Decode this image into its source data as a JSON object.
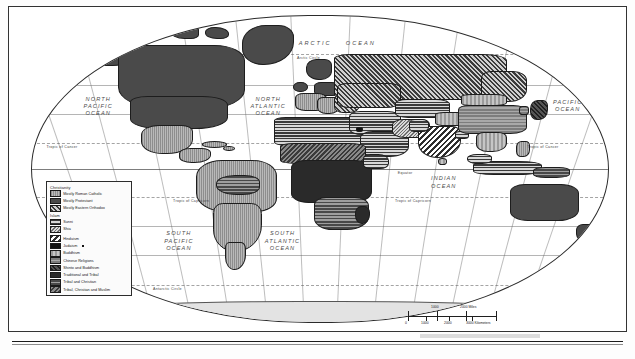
{
  "map": {
    "title_visible": false,
    "projection": "robinson-ellipse",
    "legend": {
      "groups": [
        {
          "header": "Christianity",
          "items": [
            {
              "label": "Mostly Roman Catholic",
              "pattern": "p-catholic"
            },
            {
              "label": "Mostly Protestant",
              "pattern": "p-protestant"
            },
            {
              "label": "Mostly Eastern Orthodox",
              "pattern": "p-orthodox"
            }
          ]
        },
        {
          "header": "Islam",
          "items": [
            {
              "label": "Sunni",
              "pattern": "p-sunni"
            },
            {
              "label": "Shia",
              "pattern": "p-shia"
            }
          ]
        },
        {
          "header": "",
          "items": [
            {
              "label": "Hinduism",
              "pattern": "p-hindu"
            },
            {
              "label": "Judaism",
              "pattern": "p-judaism",
              "dot": true
            },
            {
              "label": "Buddhism",
              "pattern": "p-buddhism"
            },
            {
              "label": "Chinese Religions",
              "pattern": "p-chinese"
            },
            {
              "label": "Shinto and Buddhism",
              "pattern": "p-shinto"
            },
            {
              "label": "Traditional and Tribal",
              "pattern": "p-tribal"
            },
            {
              "label": "Tribal and Christian",
              "pattern": "p-tribalchr"
            },
            {
              "label": "Tribal, Christian and Muslim",
              "pattern": "p-tribalchrmus"
            }
          ]
        }
      ]
    },
    "oceans": [
      {
        "name": "NORTH\nPACIFIC\nOCEAN",
        "line1": "NORTH",
        "line2": "PACIFIC",
        "line3": "OCEAN"
      },
      {
        "name": "NORTH ATLANTIC OCEAN",
        "line1": "NORTH",
        "line2": "ATLANTIC",
        "line3": "OCEAN"
      },
      {
        "name": "ARCTIC OCEAN",
        "line1": "ARCTIC",
        "line2": "OCEAN",
        "line3": ""
      },
      {
        "name": "PACIFIC OCEAN",
        "line1": "PACIFIC",
        "line2": "OCEAN",
        "line3": ""
      },
      {
        "name": "INDIAN OCEAN",
        "line1": "INDIAN",
        "line2": "OCEAN",
        "line3": ""
      },
      {
        "name": "SOUTH PACIFIC OCEAN",
        "line1": "SOUTH",
        "line2": "PACIFIC",
        "line3": "OCEAN"
      },
      {
        "name": "SOUTH ATLANTIC OCEAN",
        "line1": "SOUTH",
        "line2": "ATLANTIC",
        "line3": "OCEAN"
      }
    ],
    "ocean_labels": {
      "north_pacific_1": "NORTH",
      "north_pacific_2": "PACIFIC",
      "north_pacific_3": "OCEAN",
      "north_atlantic_1": "NORTH",
      "north_atlantic_2": "ATLANTIC",
      "north_atlantic_3": "OCEAN",
      "arctic_1": "ARCTIC",
      "arctic_2": "OCEAN",
      "pacific_1": "PACIFIC",
      "pacific_2": "OCEAN",
      "indian_1": "INDIAN",
      "indian_2": "OCEAN",
      "south_pacific_1": "SOUTH",
      "south_pacific_2": "PACIFIC",
      "south_pacific_3": "OCEAN",
      "south_atlantic_1": "SOUTH",
      "south_atlantic_2": "ATLANTIC",
      "south_atlantic_3": "OCEAN"
    },
    "graticule_labels": {
      "arctic_circle": "Arctic Circle",
      "tropic_cancer_left": "Tropic of Cancer",
      "tropic_cancer_right": "Tropic of Cancer",
      "equator": "Equator",
      "tropic_capricorn_left": "Tropic of Capricorn",
      "tropic_capricorn_right": "Tropic of Capricorn",
      "antarctic_circle": "Antarctic Circle"
    },
    "scale": {
      "miles_mid": "1000",
      "miles_end": "2000 Miles",
      "km_zero": "0",
      "km_mid1": "1000",
      "km_mid2": "2000",
      "km_end": "3000 Kilometers"
    },
    "footer_text": "",
    "colors": {
      "frame": "#333333",
      "graticule": "#5a5a5a",
      "land_outline": "#1d1d1d",
      "ocean_text": "#4b4b4b",
      "legend_border": "#2c2c2c",
      "legend_bg": "#fbfbfb",
      "dark_fill": "#2a2a2a",
      "light_fill": "#adadad"
    }
  }
}
